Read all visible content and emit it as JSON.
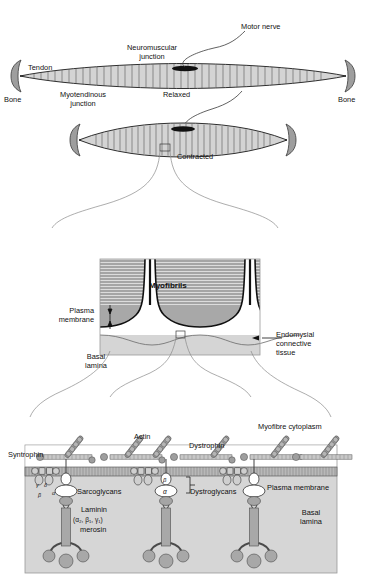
{
  "figure": {
    "domain": "biology-diagram"
  },
  "panel_relaxed": {
    "name": "Relaxed whole muscle",
    "labels": {
      "motor_nerve": "Motor nerve",
      "neuromuscular_junction": "Neuromuscular\njunction",
      "tendon": "Tendon",
      "bone_left": "Bone",
      "bone_right": "Bone",
      "myotendinous_junction": "Myotendinous\njunction",
      "state": "Relaxed"
    }
  },
  "panel_contracted": {
    "name": "Contracted whole muscle",
    "labels": {
      "state": "Contracted"
    }
  },
  "panel_myofibre": {
    "name": "Myofibre cross-section detail",
    "labels": {
      "myofibrils": "Myofibrils",
      "plasma_membrane": "Plasma\nmembrane",
      "basal_lamina": "Basal\nlamina",
      "endomysial": "Endomysial\nconnective\ntissue"
    }
  },
  "panel_molecular": {
    "name": "Dystrophin-glycoprotein complex",
    "labels": {
      "myofibre_cytoplasm": "Myofibre cytoplasm",
      "syntrophin": "Syntrophin",
      "actin": "Actin",
      "dystrophin": "Dystrophin",
      "sarcoglycans": "Sarcoglycans",
      "dystroglycans": "Dystroglycans",
      "plasma_membrane": "Plasma membrane",
      "basal_lamina": "Basal\nlamina",
      "laminin_line1": "Laminin",
      "laminin_line2": "(α₂, β₁, γ₁)",
      "laminin_line3": "merosin",
      "alpha_dystroglycan": "α",
      "beta_dystroglycan": "β",
      "sarcoglycan_subunits": [
        "γ",
        "δ",
        "β",
        "α"
      ]
    }
  },
  "colors": {
    "outline": "#1a1a1a",
    "muscle_fill": "#d2d2d2",
    "bone_fill": "#9a9a9a",
    "nerve_plate": "#111111",
    "myofibril_stripe": "#4a4a4a",
    "dark_band": "#9e9e9e",
    "endomysium": "#cfcfcf",
    "panel_bg": "#d8d8d8",
    "protein_fill": "#a8a8a8",
    "membrane": "#bdbdbd",
    "white": "#ffffff"
  }
}
